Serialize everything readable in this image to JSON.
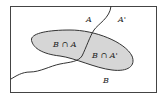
{
  "diagram": {
    "type": "venn",
    "universe_frame": true,
    "labels": {
      "A": "A",
      "A_complement": "A'",
      "B": "B",
      "B_and_A": "B ∩ A",
      "B_and_A_complement": "B ∩ A'"
    },
    "colors": {
      "region_fill": "#d6d6d6",
      "stroke": "#333333",
      "background": "#ffffff"
    }
  }
}
